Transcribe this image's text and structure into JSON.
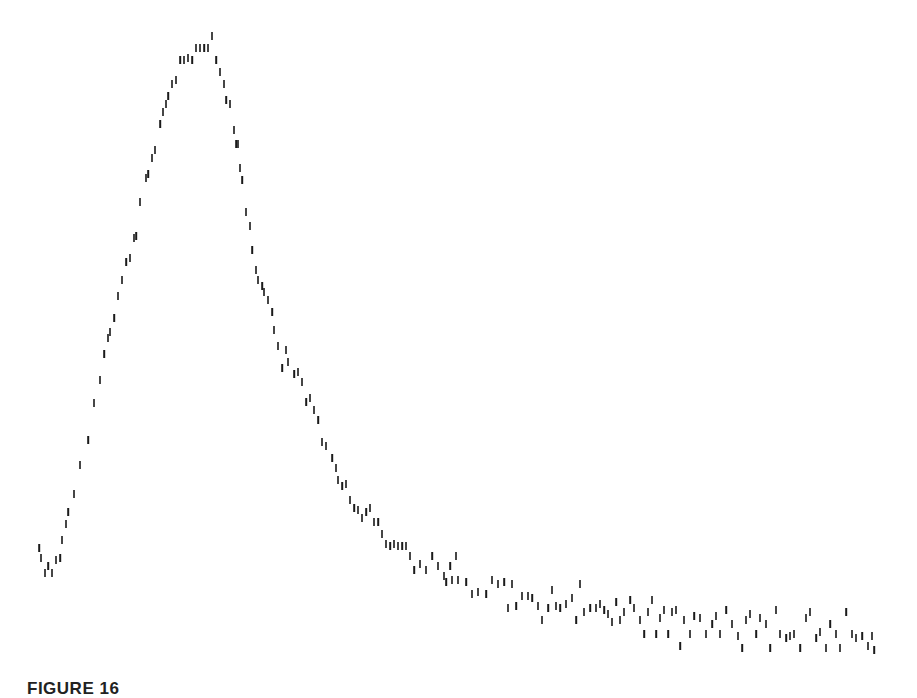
{
  "figure": {
    "caption": "FIGURE 16",
    "mark_color": "#1a1a1a",
    "background": "#ffffff"
  },
  "chart_data": {
    "type": "scatter",
    "title": "",
    "xlabel": "",
    "ylabel": "",
    "grid": false,
    "axes_visible": false,
    "marker": "vertical-tick",
    "xlim": [
      0,
      917
    ],
    "ylim": [
      691,
      0
    ],
    "series": [
      {
        "name": "rise",
        "points": [
          [
            39,
            548
          ],
          [
            41,
            558
          ],
          [
            45,
            573
          ],
          [
            48,
            566
          ],
          [
            52,
            573
          ],
          [
            56,
            560
          ],
          [
            60,
            558
          ],
          [
            62,
            540
          ],
          [
            66,
            524
          ],
          [
            68,
            512
          ],
          [
            74,
            494
          ],
          [
            80,
            465
          ],
          [
            88,
            440
          ],
          [
            94,
            403
          ],
          [
            100,
            380
          ],
          [
            104,
            354
          ],
          [
            108,
            338
          ],
          [
            110,
            332
          ],
          [
            114,
            318
          ],
          [
            118,
            296
          ],
          [
            122,
            280
          ],
          [
            126,
            262
          ],
          [
            130,
            258
          ],
          [
            134,
            238
          ],
          [
            136,
            236
          ],
          [
            140,
            202
          ],
          [
            146,
            178
          ],
          [
            148,
            174
          ],
          [
            152,
            158
          ],
          [
            155,
            150
          ],
          [
            160,
            124
          ],
          [
            163,
            112
          ],
          [
            166,
            104
          ],
          [
            168,
            96
          ],
          [
            172,
            84
          ],
          [
            176,
            80
          ],
          [
            180,
            60
          ],
          [
            184,
            60
          ],
          [
            188,
            58
          ],
          [
            192,
            60
          ],
          [
            196,
            48
          ],
          [
            200,
            48
          ],
          [
            204,
            48
          ],
          [
            208,
            48
          ],
          [
            212,
            36
          ]
        ]
      },
      {
        "name": "decay",
        "points": [
          [
            216,
            60
          ],
          [
            220,
            72
          ],
          [
            224,
            84
          ],
          [
            226,
            100
          ],
          [
            230,
            104
          ],
          [
            234,
            130
          ],
          [
            236,
            144
          ],
          [
            238,
            144
          ],
          [
            240,
            168
          ],
          [
            242,
            180
          ],
          [
            246,
            212
          ],
          [
            250,
            226
          ],
          [
            252,
            250
          ],
          [
            256,
            270
          ],
          [
            258,
            280
          ],
          [
            262,
            286
          ],
          [
            264,
            292
          ],
          [
            268,
            300
          ],
          [
            272,
            312
          ],
          [
            274,
            330
          ],
          [
            278,
            346
          ],
          [
            282,
            368
          ],
          [
            286,
            350
          ],
          [
            288,
            362
          ],
          [
            294,
            374
          ],
          [
            298,
            372
          ],
          [
            302,
            382
          ],
          [
            306,
            402
          ],
          [
            310,
            398
          ],
          [
            314,
            410
          ],
          [
            318,
            420
          ],
          [
            322,
            442
          ],
          [
            326,
            446
          ],
          [
            332,
            458
          ],
          [
            336,
            468
          ],
          [
            338,
            480
          ],
          [
            342,
            486
          ],
          [
            346,
            484
          ],
          [
            350,
            500
          ],
          [
            354,
            508
          ],
          [
            358,
            510
          ],
          [
            362,
            518
          ],
          [
            366,
            512
          ],
          [
            370,
            508
          ],
          [
            374,
            522
          ],
          [
            378,
            522
          ],
          [
            382,
            534
          ],
          [
            386,
            544
          ],
          [
            390,
            546
          ],
          [
            394,
            544
          ],
          [
            398,
            546
          ],
          [
            402,
            546
          ],
          [
            406,
            546
          ],
          [
            410,
            556
          ],
          [
            414,
            570
          ],
          [
            420,
            564
          ],
          [
            426,
            570
          ],
          [
            432,
            556
          ],
          [
            438,
            566
          ],
          [
            444,
            576
          ],
          [
            450,
            566
          ],
          [
            456,
            556
          ]
        ]
      },
      {
        "name": "baseline",
        "points": [
          [
            446,
            582
          ],
          [
            452,
            580
          ],
          [
            458,
            580
          ],
          [
            466,
            582
          ],
          [
            472,
            594
          ],
          [
            478,
            592
          ],
          [
            486,
            594
          ],
          [
            492,
            580
          ],
          [
            498,
            584
          ],
          [
            504,
            582
          ],
          [
            508,
            608
          ],
          [
            512,
            584
          ],
          [
            516,
            606
          ],
          [
            522,
            596
          ],
          [
            528,
            596
          ],
          [
            532,
            598
          ],
          [
            538,
            606
          ],
          [
            542,
            620
          ],
          [
            548,
            608
          ],
          [
            552,
            590
          ],
          [
            556,
            606
          ],
          [
            560,
            608
          ],
          [
            566,
            604
          ],
          [
            572,
            598
          ],
          [
            576,
            620
          ],
          [
            580,
            584
          ],
          [
            584,
            612
          ],
          [
            590,
            608
          ],
          [
            596,
            608
          ],
          [
            600,
            604
          ],
          [
            604,
            610
          ],
          [
            608,
            614
          ],
          [
            612,
            622
          ],
          [
            616,
            602
          ],
          [
            620,
            620
          ],
          [
            624,
            612
          ],
          [
            630,
            600
          ],
          [
            634,
            608
          ],
          [
            640,
            620
          ],
          [
            644,
            634
          ],
          [
            648,
            612
          ],
          [
            652,
            600
          ],
          [
            656,
            634
          ],
          [
            660,
            618
          ],
          [
            664,
            610
          ],
          [
            668,
            634
          ],
          [
            672,
            612
          ],
          [
            676,
            610
          ],
          [
            680,
            646
          ],
          [
            684,
            620
          ],
          [
            690,
            634
          ],
          [
            694,
            616
          ],
          [
            700,
            618
          ],
          [
            706,
            634
          ],
          [
            712,
            624
          ],
          [
            716,
            616
          ],
          [
            720,
            634
          ],
          [
            726,
            610
          ],
          [
            732,
            624
          ],
          [
            738,
            636
          ],
          [
            742,
            648
          ],
          [
            746,
            620
          ],
          [
            750,
            614
          ],
          [
            756,
            634
          ],
          [
            760,
            618
          ],
          [
            766,
            624
          ],
          [
            770,
            648
          ],
          [
            776,
            610
          ],
          [
            780,
            634
          ],
          [
            786,
            638
          ],
          [
            790,
            636
          ],
          [
            794,
            634
          ],
          [
            800,
            648
          ],
          [
            806,
            618
          ],
          [
            810,
            612
          ],
          [
            816,
            638
          ],
          [
            820,
            632
          ],
          [
            826,
            648
          ],
          [
            830,
            624
          ],
          [
            836,
            634
          ],
          [
            840,
            648
          ],
          [
            846,
            612
          ],
          [
            852,
            634
          ],
          [
            856,
            638
          ],
          [
            862,
            636
          ],
          [
            868,
            646
          ],
          [
            872,
            636
          ],
          [
            874,
            650
          ]
        ]
      }
    ]
  }
}
